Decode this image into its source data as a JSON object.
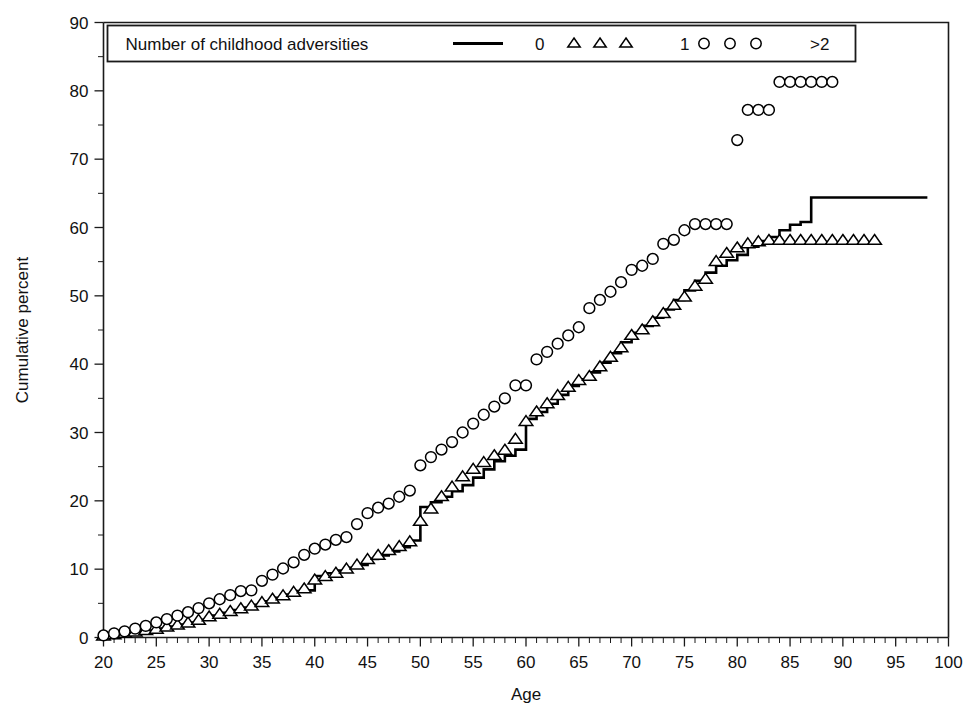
{
  "chart_data": {
    "type": "line",
    "title": "",
    "xlabel": "Age",
    "ylabel": "Cumulative percent",
    "xlim": [
      20,
      100
    ],
    "ylim": [
      0,
      90
    ],
    "xticks": [
      20,
      25,
      30,
      35,
      40,
      45,
      50,
      55,
      60,
      65,
      70,
      75,
      80,
      85,
      90,
      95,
      100
    ],
    "yticks": [
      0,
      10,
      20,
      30,
      40,
      50,
      60,
      70,
      80,
      90
    ],
    "xtick_labels": [
      "20",
      "25",
      "30",
      "35",
      "40",
      "45",
      "50",
      "55",
      "60",
      "65",
      "70",
      "75",
      "80",
      "85",
      "90",
      "95",
      "100"
    ],
    "ytick_labels": [
      "0",
      "10",
      "20",
      "30",
      "40",
      "50",
      "60",
      "70",
      "80",
      "90"
    ],
    "x_minor_step": 1,
    "y_minor_step": 5,
    "grid": false,
    "legend_position": "top",
    "legend_title": "Number of childhood adversities",
    "series": [
      {
        "name": "0",
        "label": "0",
        "style": "step-line",
        "marker": "none",
        "color": "#000000",
        "x": [
          20,
          21,
          22,
          23,
          24,
          25,
          26,
          27,
          28,
          29,
          30,
          31,
          32,
          33,
          34,
          35,
          36,
          37,
          38,
          39,
          40,
          41,
          42,
          43,
          44,
          45,
          46,
          47,
          48,
          49,
          50,
          51,
          52,
          53,
          54,
          55,
          56,
          57,
          58,
          59,
          60,
          61,
          62,
          63,
          64,
          65,
          66,
          67,
          68,
          69,
          70,
          71,
          72,
          73,
          74,
          75,
          76,
          77,
          78,
          79,
          80,
          81,
          82,
          83,
          84,
          85,
          86,
          87,
          88,
          98
        ],
        "y": [
          0.2,
          0.4,
          0.6,
          0.8,
          1.0,
          1.3,
          1.6,
          1.9,
          2.2,
          2.6,
          3.2,
          3.6,
          4.0,
          4.4,
          4.8,
          5.3,
          5.8,
          6.3,
          6.8,
          6.9,
          9.0,
          9.4,
          9.8,
          10.2,
          10.6,
          11.5,
          12.0,
          12.6,
          13.2,
          14.2,
          19.1,
          19.8,
          20.6,
          21.4,
          22.3,
          23.4,
          24.6,
          25.8,
          26.6,
          27.5,
          32.0,
          33.0,
          34.2,
          35.5,
          36.8,
          37.8,
          38.8,
          40.2,
          41.6,
          43.2,
          44.6,
          45.6,
          46.8,
          48.0,
          49.4,
          50.8,
          52.2,
          53.4,
          54.4,
          55.2,
          56.0,
          57.2,
          58.0,
          58.6,
          59.6,
          60.4,
          60.8,
          64.4,
          64.4,
          64.4
        ]
      },
      {
        "name": "1",
        "label": "1",
        "style": "markers",
        "marker": "triangle",
        "color": "#000000",
        "x": [
          20,
          21,
          22,
          23,
          24,
          25,
          26,
          27,
          28,
          29,
          30,
          31,
          32,
          33,
          34,
          35,
          36,
          37,
          38,
          39,
          40,
          41,
          42,
          43,
          44,
          45,
          46,
          47,
          48,
          49,
          50,
          51,
          52,
          53,
          54,
          55,
          56,
          57,
          58,
          59,
          60,
          61,
          62,
          63,
          64,
          65,
          66,
          67,
          68,
          69,
          70,
          71,
          72,
          73,
          74,
          75,
          76,
          77,
          78,
          79,
          80,
          81,
          82,
          83,
          84,
          85,
          86,
          87,
          88,
          89,
          90,
          91,
          92,
          93
        ],
        "y": [
          0.2,
          0.4,
          0.6,
          0.8,
          1.0,
          1.2,
          1.5,
          1.8,
          2.1,
          2.5,
          3.0,
          3.4,
          3.8,
          4.2,
          4.6,
          5.1,
          5.6,
          6.1,
          6.6,
          7.1,
          8.4,
          8.9,
          9.4,
          10.0,
          10.6,
          11.4,
          12.0,
          12.7,
          13.3,
          14.0,
          17.0,
          18.8,
          20.6,
          22.0,
          23.5,
          24.6,
          25.6,
          26.6,
          27.4,
          29.0,
          31.6,
          33.0,
          34.2,
          35.4,
          36.6,
          37.6,
          38.2,
          39.6,
          41.0,
          42.4,
          44.2,
          45.0,
          46.2,
          47.4,
          48.6,
          49.8,
          51.4,
          52.4,
          55.0,
          56.2,
          57.0,
          57.6,
          57.9,
          58.1,
          58.1,
          58.1,
          58.1,
          58.1,
          58.1,
          58.1,
          58.1,
          58.1,
          58.1,
          58.1
        ]
      },
      {
        "name": ">2",
        "label": ">2",
        "style": "markers",
        "marker": "circle",
        "color": "#000000",
        "x": [
          20,
          21,
          22,
          23,
          24,
          25,
          26,
          27,
          28,
          29,
          30,
          31,
          32,
          33,
          34,
          35,
          36,
          37,
          38,
          39,
          40,
          41,
          42,
          43,
          44,
          45,
          46,
          47,
          48,
          49,
          50,
          51,
          52,
          53,
          54,
          55,
          56,
          57,
          58,
          59,
          60,
          61,
          62,
          63,
          64,
          65,
          66,
          67,
          68,
          69,
          70,
          71,
          72,
          73,
          74,
          75,
          76,
          77,
          78,
          79,
          80,
          81,
          82,
          83,
          84,
          85,
          86,
          87,
          88,
          89
        ],
        "y": [
          0.3,
          0.6,
          0.9,
          1.3,
          1.7,
          2.2,
          2.7,
          3.2,
          3.7,
          4.3,
          5.0,
          5.6,
          6.2,
          6.8,
          6.9,
          8.3,
          9.2,
          10.1,
          11.0,
          12.1,
          13.0,
          13.6,
          14.3,
          14.7,
          16.6,
          18.2,
          19.0,
          19.6,
          20.6,
          21.5,
          25.2,
          26.4,
          27.5,
          28.6,
          30.0,
          31.3,
          32.6,
          33.8,
          35.0,
          36.9,
          36.9,
          40.7,
          41.8,
          43.0,
          44.2,
          45.4,
          48.2,
          49.4,
          50.6,
          52.0,
          53.8,
          54.4,
          55.4,
          57.6,
          58.2,
          59.6,
          60.5,
          60.5,
          60.5,
          60.5,
          72.8,
          77.2,
          77.2,
          77.2,
          81.3,
          81.3,
          81.3,
          81.3,
          81.3,
          81.3
        ]
      }
    ]
  },
  "legend": {
    "title": "Number of childhood adversities",
    "entries": [
      {
        "label": "0",
        "marker": "line"
      },
      {
        "label": "1",
        "marker": "triangle"
      },
      {
        "label": ">2",
        "marker": "circle"
      }
    ]
  },
  "axes": {
    "x_title": "Age",
    "y_title": "Cumulative percent"
  }
}
